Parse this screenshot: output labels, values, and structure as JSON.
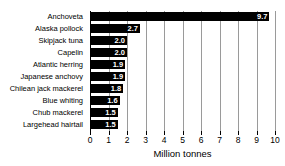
{
  "chart_data": {
    "type": "bar",
    "orientation": "horizontal",
    "title": "",
    "xlabel": "Million tonnes",
    "ylabel": "",
    "xlim": [
      0,
      10
    ],
    "grid": true,
    "legend": false,
    "xticks": [
      "0",
      "1",
      "2",
      "3",
      "4",
      "5",
      "6",
      "7",
      "8",
      "9",
      "10"
    ],
    "categories": [
      "Anchoveta",
      "Alaska pollock",
      "Skipjack tuna",
      "Capelin",
      "Atlantic herring",
      "Japanese anchovy",
      "Chilean jack mackerel",
      "Blue whiting",
      "Chub mackerel",
      "Largehead hairtail"
    ],
    "values": [
      9.7,
      2.7,
      2.0,
      2.0,
      1.9,
      1.9,
      1.8,
      1.6,
      1.5,
      1.5
    ],
    "value_labels": [
      "9.7",
      "2.7",
      "2.0",
      "2.0",
      "1.9",
      "1.9",
      "1.8",
      "1.6",
      "1.5",
      "1.5"
    ],
    "bar_color": "#000000",
    "value_label_color": "#ffffff",
    "gridline_color": "#9a9a9a",
    "axis_color": "#000000",
    "background_color": "#ffffff"
  }
}
